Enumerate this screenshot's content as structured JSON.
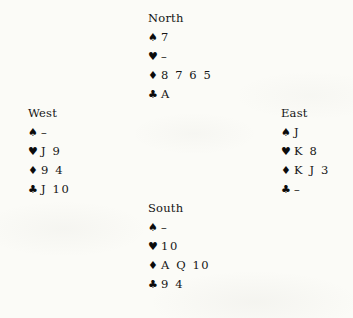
{
  "diagram": {
    "type": "bridge-hand-diagram",
    "suit_symbols": {
      "spade": "♠",
      "heart": "♥",
      "diamond": "♦",
      "club": "♣"
    },
    "void_marker": "–",
    "text_color": "#141414",
    "background_color": "#fbfbf7",
    "hands": {
      "north": {
        "label": "North",
        "spades": "7",
        "hearts": "–",
        "diamonds": "8 7 6 5",
        "clubs": "A"
      },
      "west": {
        "label": "West",
        "spades": "–",
        "hearts": "J 9",
        "diamonds": "9 4",
        "clubs": "J 10"
      },
      "east": {
        "label": "East",
        "spades": "J",
        "hearts": "K 8",
        "diamonds": "K J 3",
        "clubs": "–"
      },
      "south": {
        "label": "South",
        "spades": "–",
        "hearts": "10",
        "diamonds": "A Q 10",
        "clubs": "9 4"
      }
    }
  }
}
